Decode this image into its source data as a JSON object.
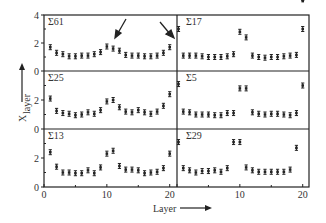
{
  "chart_data": {
    "type": "scatter",
    "layout": "3x2 panel grid",
    "xlabel": "Layer",
    "ylabel": "X_layer",
    "ylabel_main": "X",
    "ylabel_sub": "layer",
    "xlim": [
      0,
      21
    ],
    "ylim": [
      0,
      4
    ],
    "x_ticks": [
      "0",
      "10",
      "20"
    ],
    "x_tick_values": [
      0,
      10,
      20
    ],
    "y_ticks": [
      "0",
      "2",
      "4"
    ],
    "y_tick_values": [
      0,
      2,
      4
    ],
    "grid": false,
    "markers": "points with error bars",
    "panels": [
      {
        "name": "Σ61",
        "row": 0,
        "col": 0,
        "x": [
          1,
          2,
          3,
          4,
          5,
          6,
          7,
          8,
          9,
          10,
          11,
          12,
          13,
          14,
          15,
          16,
          17,
          18,
          19,
          20
        ],
        "y": [
          1.7,
          1.3,
          1.2,
          1.05,
          1.05,
          1.1,
          1.1,
          1.2,
          1.35,
          1.75,
          1.6,
          1.45,
          1.15,
          1.1,
          1.1,
          1.05,
          1.05,
          1.1,
          1.3,
          1.7
        ],
        "annotations": [
          "arrow pointing at layer 10",
          "arrow pointing at layer 20"
        ]
      },
      {
        "name": "Σ17",
        "row": 0,
        "col": 1,
        "x": [
          0,
          1,
          2,
          3,
          4,
          5,
          6,
          7,
          8,
          9,
          10,
          11,
          12,
          13,
          14,
          15,
          16,
          17,
          18,
          19,
          20
        ],
        "y": [
          3.0,
          1.1,
          1.1,
          1.1,
          1.05,
          1.0,
          1.0,
          1.0,
          1.05,
          1.2,
          2.8,
          2.4,
          1.1,
          1.0,
          0.95,
          1.0,
          1.0,
          1.05,
          1.1,
          1.15,
          3.0
        ]
      },
      {
        "name": "Σ25",
        "row": 1,
        "col": 0,
        "x": [
          1,
          2,
          3,
          4,
          5,
          6,
          7,
          8,
          9,
          10,
          11,
          12,
          13,
          14,
          15,
          16,
          17,
          18,
          19,
          20
        ],
        "y": [
          2.1,
          1.25,
          1.1,
          1.05,
          0.95,
          1.0,
          1.15,
          1.05,
          1.3,
          1.9,
          2.0,
          1.5,
          1.2,
          1.15,
          1.3,
          1.15,
          1.05,
          1.2,
          1.6,
          2.4
        ]
      },
      {
        "name": "Σ5",
        "row": 1,
        "col": 1,
        "x": [
          0,
          1,
          2,
          3,
          4,
          5,
          6,
          7,
          8,
          9,
          10,
          11,
          12,
          13,
          14,
          15,
          16,
          17,
          18,
          19,
          20
        ],
        "y": [
          3.1,
          1.2,
          1.15,
          1.0,
          1.0,
          1.0,
          0.95,
          0.95,
          1.1,
          1.1,
          2.8,
          2.8,
          1.15,
          1.05,
          1.0,
          1.05,
          1.05,
          1.0,
          0.95,
          1.1,
          3.0
        ]
      },
      {
        "name": "Σ13",
        "row": 2,
        "col": 0,
        "x": [
          1,
          2,
          3,
          4,
          5,
          6,
          7,
          8,
          9,
          10,
          11,
          12,
          13,
          14,
          15,
          16,
          17,
          18,
          19,
          20
        ],
        "y": [
          2.4,
          1.4,
          1.0,
          1.0,
          0.95,
          0.95,
          1.15,
          0.95,
          1.35,
          2.3,
          2.5,
          1.45,
          1.2,
          1.2,
          1.15,
          0.95,
          1.0,
          1.05,
          1.3,
          2.3
        ]
      },
      {
        "name": "Σ29",
        "row": 2,
        "col": 1,
        "x": [
          0,
          1,
          2,
          3,
          4,
          5,
          6,
          7,
          8,
          9,
          10,
          11,
          12,
          13,
          14,
          15,
          16,
          17,
          18,
          19,
          20
        ],
        "y": [
          3.1,
          1.3,
          1.15,
          1.0,
          1.1,
          1.1,
          1.15,
          1.05,
          1.3,
          3.1,
          3.1,
          1.35,
          1.15,
          1.05,
          1.05,
          1.05,
          1.05,
          1.05,
          1.2,
          2.7
        ]
      }
    ]
  }
}
